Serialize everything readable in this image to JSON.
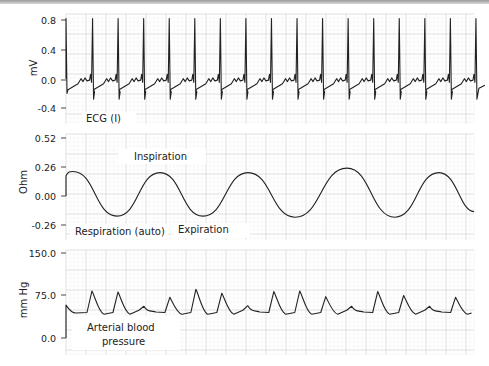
{
  "chart_data": [
    {
      "type": "line",
      "title": "ECG (I)",
      "ylabel": "mV",
      "ylim": [
        -0.45,
        0.85
      ],
      "yticks": [
        "0.8",
        "0.4",
        "0.0",
        "-0.4"
      ],
      "ytick_values": [
        0.8,
        0.4,
        0.0,
        -0.4
      ],
      "grid": true,
      "annotations": [
        "ECG (I)"
      ],
      "series": [
        {
          "name": "ECG (I)",
          "beats": 16,
          "baseline": -0.05,
          "r_peak": 0.82,
          "s_trough": -0.28,
          "t_wave": 0.02
        }
      ]
    },
    {
      "type": "line",
      "title": "Respiration (auto)",
      "ylabel": "Ohm",
      "ylim": [
        -0.3,
        0.55
      ],
      "yticks": [
        "0.52",
        "0.26",
        "0.00",
        "-0.26"
      ],
      "ytick_values": [
        0.52,
        0.26,
        0.0,
        -0.26
      ],
      "grid": true,
      "annotations": [
        "Inspiration",
        "Respiration (auto)",
        "Expiration"
      ],
      "series": [
        {
          "name": "Respiration (auto)",
          "cycles": 5,
          "peaks": [
            0.22,
            0.21,
            0.21,
            0.25,
            0.21
          ],
          "troughs": [
            -0.18,
            -0.18,
            -0.19,
            -0.19,
            -0.14
          ]
        }
      ]
    },
    {
      "type": "line",
      "title": "Arterial blood pressure",
      "ylabel": "mm Hg",
      "ylim": [
        0,
        150
      ],
      "yticks": [
        "150.0",
        "75.0",
        "0.0"
      ],
      "ytick_values": [
        150,
        75,
        0
      ],
      "grid": true,
      "annotations": [
        "Arterial blood",
        "pressure"
      ],
      "series": [
        {
          "name": "Arterial blood pressure",
          "systolic_peaks": [
            58,
            83,
            81,
            56,
            72,
            86,
            79,
            57,
            82,
            83,
            73,
            56,
            82,
            75,
            56,
            72
          ],
          "diastolic": 44
        }
      ]
    }
  ]
}
